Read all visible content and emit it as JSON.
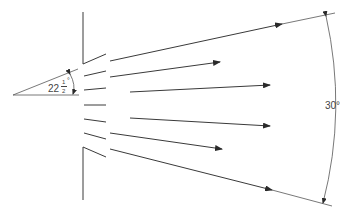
{
  "diagram": {
    "angle_small": {
      "whole": "22",
      "numerator": "1",
      "denominator": "2",
      "unit": "°",
      "label": "22½°"
    },
    "angle_large": {
      "label": "30°"
    },
    "arrows": [
      {
        "name": "upper-outer",
        "from": [
          110,
          61
        ],
        "to": [
          282,
          24
        ]
      },
      {
        "name": "upper-mid",
        "from": [
          110,
          77
        ],
        "to": [
          220,
          62
        ]
      },
      {
        "name": "upper-inner",
        "from": [
          130,
          92
        ],
        "to": [
          270,
          84
        ]
      },
      {
        "name": "lower-inner",
        "from": [
          130,
          119
        ],
        "to": [
          270,
          127
        ]
      },
      {
        "name": "lower-mid",
        "from": [
          110,
          133
        ],
        "to": [
          222,
          149
        ]
      },
      {
        "name": "lower-outer",
        "from": [
          110,
          148
        ],
        "to": [
          272,
          190
        ]
      }
    ],
    "colors": {
      "line": "#3a3a3a",
      "background": "#ffffff"
    }
  }
}
